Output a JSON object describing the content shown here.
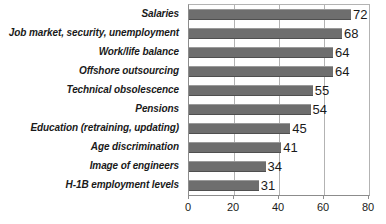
{
  "chart_data": {
    "type": "bar",
    "orientation": "horizontal",
    "title": "",
    "xlabel": "",
    "ylabel": "",
    "xlim": [
      0,
      80
    ],
    "xticks": [
      0,
      20,
      40,
      60,
      80
    ],
    "grid": true,
    "legend": false,
    "bar_color": "#6e6e6e",
    "show_data_labels": true,
    "categories": [
      "Salaries",
      "Job market, security, unemployment",
      "Work/life balance",
      "Offshore outsourcing",
      "Technical obsolescence",
      "Pensions",
      "Education (retraining, updating)",
      "Age discrimination",
      "Image of engineers",
      "H-1B employment levels"
    ],
    "values": [
      72,
      68,
      64,
      64,
      55,
      54,
      45,
      41,
      34,
      31
    ]
  }
}
